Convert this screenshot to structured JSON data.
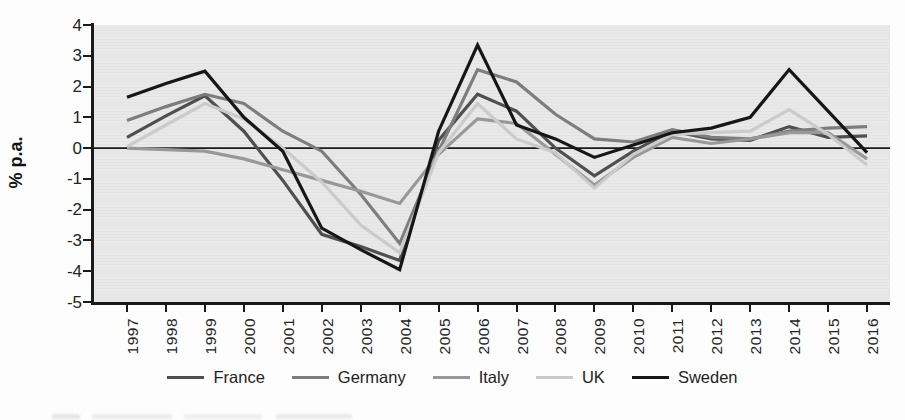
{
  "chart_data": {
    "type": "line",
    "title": "",
    "xlabel": "",
    "ylabel": "% p.a.",
    "ylim": [
      -5,
      4
    ],
    "yticks": [
      "4",
      "3",
      "2",
      "1",
      "0",
      "-1",
      "-2",
      "-3",
      "-4",
      "-5"
    ],
    "zero_line": true,
    "grid": false,
    "legend_position": "bottom",
    "x": [
      "1997",
      "1998",
      "1999",
      "2000",
      "2001",
      "2002",
      "2003",
      "2004",
      "2005",
      "2006",
      "2007",
      "2008",
      "2009",
      "2010",
      "2011",
      "2012",
      "2013",
      "2014",
      "2015",
      "2016"
    ],
    "series": [
      {
        "name": "France",
        "color": "#4f4f4f",
        "values": [
          0.35,
          1.05,
          1.7,
          0.55,
          -1.05,
          -2.8,
          -3.2,
          -3.65,
          0.25,
          1.75,
          1.2,
          0.0,
          -0.9,
          -0.1,
          0.55,
          0.3,
          0.25,
          0.7,
          0.35,
          0.4
        ]
      },
      {
        "name": "Germany",
        "color": "#7d7d7d",
        "values": [
          0.9,
          1.35,
          1.75,
          1.45,
          0.55,
          -0.1,
          -1.5,
          -3.1,
          -0.1,
          2.55,
          2.15,
          1.1,
          0.3,
          0.2,
          0.6,
          0.35,
          0.3,
          0.55,
          0.65,
          0.7
        ]
      },
      {
        "name": "Italy",
        "color": "#989898",
        "values": [
          0.0,
          -0.05,
          -0.1,
          -0.35,
          -0.7,
          -1.05,
          -1.4,
          -1.8,
          -0.2,
          0.95,
          0.8,
          -0.2,
          -1.2,
          -0.3,
          0.35,
          0.15,
          0.3,
          0.5,
          0.5,
          -0.35
        ]
      },
      {
        "name": "UK",
        "color": "#cbcbcb",
        "values": [
          0.05,
          0.75,
          1.45,
          0.95,
          0.0,
          -1.1,
          -2.5,
          -3.4,
          -0.15,
          1.45,
          0.3,
          -0.15,
          -1.3,
          -0.2,
          0.45,
          0.5,
          0.55,
          1.25,
          0.45,
          -0.55
        ]
      },
      {
        "name": "Sweden",
        "color": "#161616",
        "values": [
          1.65,
          2.1,
          2.5,
          1.0,
          -0.1,
          -2.6,
          -3.3,
          -3.95,
          0.55,
          3.35,
          0.75,
          0.3,
          -0.3,
          0.1,
          0.5,
          0.65,
          1.0,
          2.55,
          1.2,
          -0.15
        ]
      }
    ]
  }
}
